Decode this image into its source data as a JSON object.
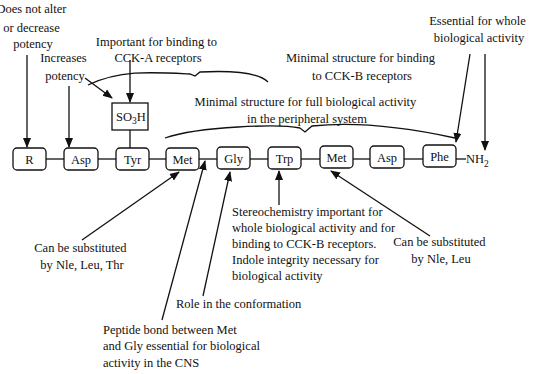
{
  "residues": [
    {
      "label": "R"
    },
    {
      "label": "Asp"
    },
    {
      "label": "Tyr"
    },
    {
      "label": "Met"
    },
    {
      "label": "Gly"
    },
    {
      "label": "Trp"
    },
    {
      "label": "Met"
    },
    {
      "label": "Asp"
    },
    {
      "label": "Phe"
    }
  ],
  "c_terminus": {
    "main": "NH",
    "sub": "2"
  },
  "sulfate": {
    "main": "SO",
    "sub": "3",
    "tail": "H"
  },
  "annotations": {
    "r_group": [
      "Does not alter",
      "or decrease",
      "potency"
    ],
    "asp1": [
      "Increases",
      "potency"
    ],
    "sulfate_binding": [
      "Important for binding to",
      "CCK-A receptors"
    ],
    "cck_b_minimal": [
      "Minimal structure for binding",
      "to CCK-B receptors"
    ],
    "peripheral_minimal": [
      "Minimal structure for full biological activity",
      "in the peripheral system"
    ],
    "phe_nh2": [
      "Essential for whole",
      "biological activity"
    ],
    "met1_subst": [
      "Can be substituted",
      "by Nle, Leu, Thr"
    ],
    "peptide_bond": [
      "Peptide bond between Met",
      "and Gly essential for biological",
      "activity in the CNS"
    ],
    "gly_role": [
      "Role in the conformation"
    ],
    "trp": [
      "Stereochemistry important for",
      "whole biological activity and for",
      "binding to CCK-B receptors.",
      "Indole integrity necessary for",
      "biological activity"
    ],
    "met2_subst": [
      "Can be substituted",
      "by Nle, Leu"
    ]
  }
}
